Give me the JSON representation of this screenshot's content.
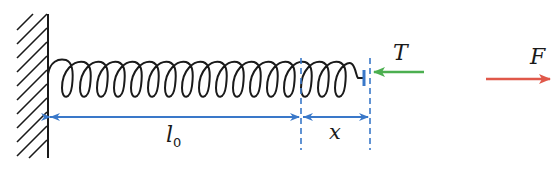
{
  "diagram": {
    "labels": {
      "natural_length": "l",
      "natural_length_sub": "0",
      "extension": "x",
      "tension": "T",
      "applied_force": "F"
    },
    "colors": {
      "spring": "#1a1a1a",
      "wall": "#1a1a1a",
      "dimension": "#3a78c9",
      "tension_arrow": "#4caf50",
      "force_arrow": "#e0584a"
    },
    "spring": {
      "coil_count": 18
    }
  }
}
